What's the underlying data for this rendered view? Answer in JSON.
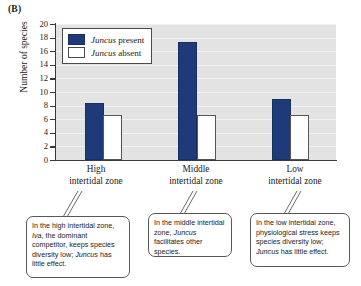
{
  "panel_label": "(B)",
  "chart_data": {
    "type": "bar",
    "title": "",
    "xlabel": "",
    "ylabel": "Number of species",
    "ylim": [
      0,
      20
    ],
    "ytick_step": 2,
    "yticks": [
      20,
      18,
      16,
      14,
      12,
      10,
      8,
      6,
      4,
      2,
      0
    ],
    "grid": true,
    "legend_position": "upper-left-inside",
    "categories": [
      "High\nintertidal zone",
      "Middle\nintertidal zone",
      "Low\nintertidal zone"
    ],
    "category_labels": [
      {
        "line1": "High",
        "line2": "intertidal zone"
      },
      {
        "line1": "Middle",
        "line2": "intertidal zone"
      },
      {
        "line1": "Low",
        "line2": "intertidal zone"
      }
    ],
    "series": [
      {
        "name": "Juncus present",
        "values": [
          8.1,
          17.1,
          8.7
        ],
        "color": "#1f3a78"
      },
      {
        "name": "Juncus absent",
        "values": [
          6.3,
          6.3,
          6.3
        ],
        "color": "#ffffff"
      }
    ],
    "annotations": [
      "In the high intertidal zone, Iva, the dominant competitor, keeps species diversity low; Juncus has little effect.",
      "In the middle intertidal zone, Juncus facilitates other species.",
      "In the low intertidal zone, physiological stress keeps species diversity low; Juncus has little effect."
    ]
  },
  "legend": {
    "items": [
      {
        "genus": "Juncus",
        "rest": " present"
      },
      {
        "genus": "Juncus",
        "rest": " absent"
      }
    ]
  },
  "callouts": [
    {
      "id": "callout-high",
      "segments": [
        {
          "text": "In the high intertidal zone, ",
          "italic": false
        },
        {
          "text": "Iva",
          "italic": true
        },
        {
          "text": ", the dominant competitor, keeps species diversity low; ",
          "italic": false
        },
        {
          "text": "Juncus",
          "italic": true
        },
        {
          "text": " has little effect.",
          "italic": false
        }
      ]
    },
    {
      "id": "callout-middle",
      "segments": [
        {
          "text": "In the middle intertidal zone, ",
          "italic": false
        },
        {
          "text": "Juncus",
          "italic": true
        },
        {
          "text": " facilitates other species.",
          "italic": false
        }
      ]
    },
    {
      "id": "callout-low",
      "segments": [
        {
          "text": "In the low intertidal zone, physiological stress keeps species diversity low; ",
          "italic": false
        },
        {
          "text": "Juncus",
          "italic": true
        },
        {
          "text": " has little effect.",
          "italic": false
        }
      ]
    }
  ],
  "colors": {
    "bar_present": "#1f3a78",
    "bar_absent": "#ffffff",
    "plot_background": "#e3e3e3",
    "axis": "#3a3a3a",
    "gridline": "#f2f2f2",
    "callout_border": "#58595b"
  }
}
